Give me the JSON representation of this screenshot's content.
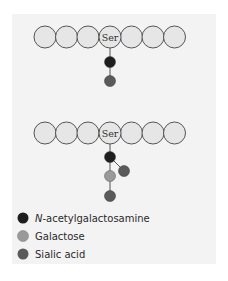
{
  "diagram": {
    "panel_color": "#f3f3f3",
    "amino_acid_fill": "#e6e6e6",
    "amino_acid_stroke": "#555555",
    "ser_label": "Ser",
    "structure_1": {
      "description": "O-linked: Ser - GalNAc - Sialic acid",
      "chain": [
        "",
        "",
        "",
        "Ser",
        "",
        "",
        ""
      ],
      "sugars": [
        "N-acetylgalactosamine",
        "Sialic acid"
      ]
    },
    "structure_2": {
      "description": "O-linked: Ser - GalNAc (branch Sialic acid) - Galactose - Sialic acid",
      "chain": [
        "",
        "",
        "",
        "Ser",
        "",
        "",
        ""
      ],
      "sugars": [
        "N-acetylgalactosamine",
        "Sialic acid (branch)",
        "Galactose",
        "Sialic acid"
      ]
    }
  },
  "legend": {
    "items": [
      {
        "prefix_italic": "N",
        "label": "-acetylgalactosamine",
        "color": "#1e1e1e"
      },
      {
        "prefix_italic": "",
        "label": "Galactose",
        "color": "#9a9a9a"
      },
      {
        "prefix_italic": "",
        "label": "Sialic acid",
        "color": "#5a5a5a"
      }
    ]
  }
}
